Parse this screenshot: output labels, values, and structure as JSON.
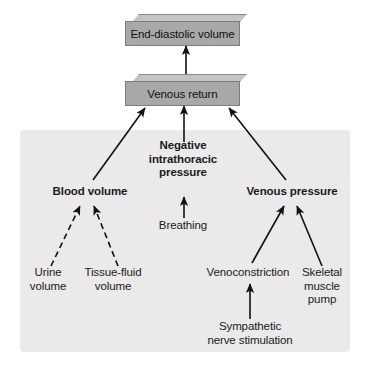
{
  "figure": {
    "type": "flow-diagram",
    "background_color": "#ffffff",
    "panel_color": "#eaeaea",
    "box_fill_color": "#a8a8a8",
    "box_top_color": "#c4c4c4",
    "text_color": "#1a1a1a"
  },
  "boxes": [
    {
      "id": "end-diastolic-volume",
      "label": "End-diastolic volume",
      "x": 125,
      "y": 14,
      "width": 122,
      "height": 25,
      "depth": 7
    },
    {
      "id": "venous-return",
      "label": "Venous return",
      "x": 125,
      "y": 74,
      "width": 122,
      "height": 25,
      "depth": 7
    }
  ],
  "labels": [
    {
      "id": "blood-volume",
      "text": "Blood volume",
      "x": 90,
      "y": 192,
      "bold": true,
      "size": 11.5
    },
    {
      "id": "negative-intrathoracic-pressure",
      "text": "Negative\nintrathoracic\npressure",
      "x": 183,
      "y": 159,
      "bold": true,
      "size": 11.5
    },
    {
      "id": "venous-pressure",
      "text": "Venous pressure",
      "x": 292,
      "y": 192,
      "bold": true,
      "size": 11.5
    },
    {
      "id": "breathing",
      "text": "Breathing",
      "x": 183,
      "y": 225,
      "bold": false,
      "size": 11.5
    },
    {
      "id": "urine-volume",
      "text": "Urine\nvolume",
      "x": 48,
      "y": 279,
      "bold": false,
      "size": 11.5
    },
    {
      "id": "tissue-fluid-volume",
      "text": "Tissue-fluid\nvolume",
      "x": 113,
      "y": 279,
      "bold": false,
      "size": 11.5
    },
    {
      "id": "venoconstriction",
      "text": "Venoconstriction",
      "x": 248,
      "y": 272,
      "bold": false,
      "size": 11.5
    },
    {
      "id": "skeletal-muscle-pump",
      "text": "Skeletal\nmuscle\npump",
      "x": 322,
      "y": 279,
      "bold": false,
      "size": 11.5
    },
    {
      "id": "sympathetic-nerve-stimulation",
      "text": "Sympathetic\nnerve stimulation",
      "x": 250,
      "y": 329,
      "bold": false,
      "size": 11.5
    }
  ],
  "panel": {
    "x": 20,
    "y": 130,
    "width": 330,
    "height": 222,
    "corner_radius": 4
  },
  "connections": [
    {
      "id": "venous-return-to-end-diastolic-volume",
      "from": "venous-return",
      "to": "end-diastolic-volume",
      "style": "solid"
    },
    {
      "id": "blood-volume-to-venous-return",
      "from": "blood-volume",
      "to": "venous-return",
      "style": "solid"
    },
    {
      "id": "negative-intrathoracic-pressure-to-venous-return",
      "from": "negative-intrathoracic-pressure",
      "to": "venous-return",
      "style": "solid"
    },
    {
      "id": "venous-pressure-to-venous-return",
      "from": "venous-pressure",
      "to": "venous-return",
      "style": "solid"
    },
    {
      "id": "breathing-to-negative-intrathoracic-pressure",
      "from": "breathing",
      "to": "negative-intrathoracic-pressure",
      "style": "solid"
    },
    {
      "id": "urine-volume-to-blood-volume",
      "from": "urine-volume",
      "to": "blood-volume",
      "style": "dashed"
    },
    {
      "id": "tissue-fluid-volume-to-blood-volume",
      "from": "tissue-fluid-volume",
      "to": "blood-volume",
      "style": "dashed"
    },
    {
      "id": "venoconstriction-to-venous-pressure",
      "from": "venoconstriction",
      "to": "venous-pressure",
      "style": "solid"
    },
    {
      "id": "skeletal-muscle-pump-to-venous-pressure",
      "from": "skeletal-muscle-pump",
      "to": "venous-pressure",
      "style": "solid"
    },
    {
      "id": "sympathetic-nerve-stimulation-to-venoconstriction",
      "from": "sympathetic-nerve-stimulation",
      "to": "venoconstriction",
      "style": "solid"
    }
  ]
}
